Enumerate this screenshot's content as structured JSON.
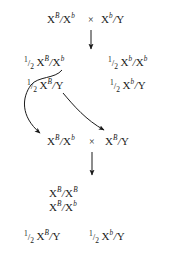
{
  "diagram": {
    "type": "genetic-cross-pedigree",
    "title_text": "",
    "ink_color": "#1a1a1a",
    "background_color": "#ffffff",
    "cross_symbol": "×",
    "fraction": {
      "numerator": "1",
      "bar": "/",
      "denominator": "2",
      "text": "1/2"
    },
    "parental_cross": {
      "label": "parental-cross",
      "left": {
        "base": "X",
        "sup1": "B",
        "slash": "/",
        "base2": "X",
        "sup2": "b"
      },
      "symbol": "×",
      "right": {
        "base": "X",
        "sup1": "b",
        "slash": "/",
        "base2": "Y",
        "sup2": ""
      }
    },
    "f1_row_1": {
      "label": "f1-gametes-row-1",
      "left": {
        "fraction": "1/2",
        "base": "X",
        "sup1": "B",
        "slash": "/",
        "base2": "X",
        "sup2": "b"
      },
      "right": {
        "fraction": "1/2",
        "base": "X",
        "sup1": "b",
        "slash": "/",
        "base2": "X",
        "sup2": "b"
      }
    },
    "f1_row_2": {
      "label": "f1-gametes-row-2",
      "left": {
        "fraction": "1/2",
        "base": "X",
        "sup1": "B",
        "slash": "/",
        "base2": "Y",
        "sup2": ""
      },
      "right": {
        "fraction": "1/2",
        "base": "X",
        "sup1": "b",
        "slash": "/",
        "base2": "Y",
        "sup2": ""
      }
    },
    "second_cross": {
      "label": "second-cross",
      "left": {
        "base": "X",
        "sup1": "B",
        "slash": "/",
        "base2": "X",
        "sup2": "b"
      },
      "symbol": "×",
      "right": {
        "base": "X",
        "sup1": "B",
        "slash": "/",
        "base2": "Y",
        "sup2": ""
      }
    },
    "f2_females": {
      "label": "f2-female-offspring",
      "line1": {
        "base": "X",
        "sup1": "B",
        "slash": "/",
        "base2": "X",
        "sup2": "B"
      },
      "line2": {
        "base": "X",
        "sup1": "B",
        "slash": "/",
        "base2": "X",
        "sup2": "b"
      }
    },
    "f2_males": {
      "label": "f2-male-offspring",
      "left": {
        "fraction": "1/2",
        "base": "X",
        "sup1": "B",
        "slash": "/",
        "base2": "Y",
        "sup2": ""
      },
      "right": {
        "fraction": "1/2",
        "base": "X",
        "sup1": "b",
        "slash": "/",
        "base2": "Y",
        "sup2": ""
      }
    },
    "arrows": [
      {
        "name": "arrow-parental-to-f1",
        "kind": "straight-down"
      },
      {
        "name": "arrow-f1-female-to-second-cross",
        "kind": "curved"
      },
      {
        "name": "arrow-f1-male-to-second-cross",
        "kind": "curved"
      },
      {
        "name": "arrow-second-cross-to-f2",
        "kind": "straight-down"
      }
    ]
  }
}
